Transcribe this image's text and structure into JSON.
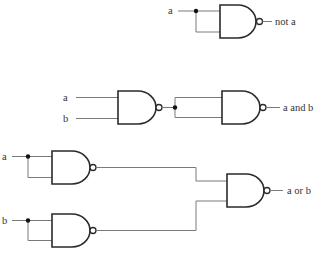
{
  "diagram": {
    "title": "",
    "circuits": [
      {
        "name": "not",
        "inputs": [
          {
            "label": "a"
          }
        ],
        "output_label": "not a"
      },
      {
        "name": "and",
        "inputs": [
          {
            "label": "a"
          },
          {
            "label": "b"
          }
        ],
        "output_label": "a and b"
      },
      {
        "name": "or",
        "inputs": [
          {
            "label": "a"
          },
          {
            "label": "b"
          }
        ],
        "output_label": "a or b"
      }
    ],
    "gate_type": "NAND",
    "colors": {
      "wire": "#7a7a7a",
      "gate_outline": "#2a2a2a",
      "junction_dot": "#111111",
      "label": "#333333",
      "background": "#ffffff"
    }
  }
}
